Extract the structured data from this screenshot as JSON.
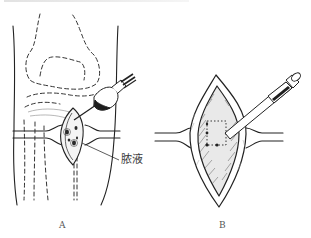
{
  "figure": {
    "type": "medical-line-illustration",
    "panels": [
      {
        "id": "A",
        "label": "A",
        "description": "Knee joint with dashed bone outlines, incision, and aspiration syringe",
        "annotations": [
          {
            "text": "脓液"
          }
        ]
      },
      {
        "id": "B",
        "label": "B",
        "description": "Opened incision with cannula inserted and dotted bone window"
      }
    ],
    "colors": {
      "ink": "#222222",
      "paper": "#ffffff",
      "shade": "#555555"
    }
  }
}
